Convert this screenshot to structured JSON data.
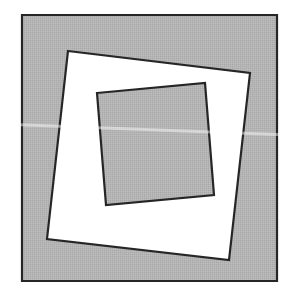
{
  "figure": {
    "colors": {
      "background": "#ffffff",
      "gray_fill": "#b4b4b4",
      "white_fill": "#ffffff",
      "stroke": "#262626",
      "scan_streak": "#dedede"
    },
    "shapes": {
      "outer_square": {
        "fill": "gray",
        "points": [
          [
            22,
            15
          ],
          [
            277,
            15
          ],
          [
            277,
            281
          ],
          [
            22,
            281
          ]
        ]
      },
      "middle_square": {
        "fill": "white",
        "points": [
          [
            68,
            51
          ],
          [
            250,
            73
          ],
          [
            229,
            260
          ],
          [
            47,
            239
          ]
        ]
      },
      "inner_square": {
        "fill": "gray",
        "points": [
          [
            97,
            93
          ],
          [
            205,
            83
          ],
          [
            214,
            195
          ],
          [
            106,
            205
          ]
        ]
      }
    },
    "streak": {
      "from": [
        0,
        124
      ],
      "to": [
        290,
        135
      ]
    }
  }
}
